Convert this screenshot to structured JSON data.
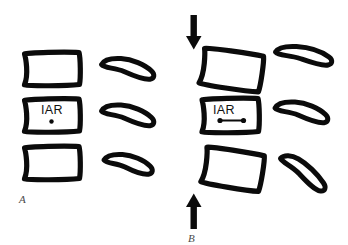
{
  "figure": {
    "background_color": "#ffffff",
    "ink_color": "#0b0b0b",
    "label_color": "#4a4a4a"
  },
  "panels": [
    {
      "id": "A",
      "label": "A",
      "caption_text": "A",
      "iar_label": "IAR",
      "iar_marker": "single-dot",
      "force_arrows": [],
      "vertebral_bodies": [
        {
          "name": "upper-vertebral-body",
          "tilt_deg": 0
        },
        {
          "name": "middle-vertebral-body",
          "tilt_deg": 0
        },
        {
          "name": "lower-vertebral-body",
          "tilt_deg": 0
        }
      ],
      "spinous_processes": [
        {
          "name": "upper-spinous-process",
          "tilt_deg": -16
        },
        {
          "name": "middle-spinous-process",
          "tilt_deg": -16
        },
        {
          "name": "lower-spinous-process",
          "tilt_deg": -14
        }
      ]
    },
    {
      "id": "B",
      "label": "B",
      "caption_text": "B",
      "iar_label": "IAR",
      "iar_marker": "dot-line-dot",
      "force_arrows": [
        {
          "name": "top-force-arrow",
          "direction": "down"
        },
        {
          "name": "bottom-force-arrow",
          "direction": "up"
        }
      ],
      "vertebral_bodies": [
        {
          "name": "upper-vertebral-body",
          "tilt_deg": 9
        },
        {
          "name": "middle-vertebral-body",
          "tilt_deg": 0
        },
        {
          "name": "lower-vertebral-body",
          "tilt_deg": 10
        }
      ],
      "spinous_processes": [
        {
          "name": "upper-spinous-process",
          "tilt_deg": -12
        },
        {
          "name": "middle-spinous-process",
          "tilt_deg": -16
        },
        {
          "name": "lower-spinous-process",
          "tilt_deg": -26
        }
      ]
    }
  ]
}
